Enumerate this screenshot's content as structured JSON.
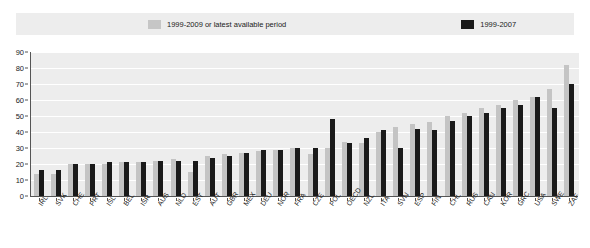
{
  "legend": {
    "entries": [
      {
        "label": "1999-2009 or latest available period",
        "color": "#c6c6c6",
        "swatch": "light"
      },
      {
        "label": "1999-2007",
        "color": "#1a1a1a",
        "swatch": "dark"
      }
    ]
  },
  "y_axis": {
    "ticks": [
      "0",
      "10",
      "20",
      "30",
      "40",
      "50",
      "60",
      "70",
      "80",
      "90"
    ]
  },
  "chart_data": {
    "type": "bar",
    "title": "",
    "subtitle": "",
    "xlabel": "",
    "ylabel": "",
    "ylim": [
      0,
      90
    ],
    "ytick_step": 10,
    "grid": true,
    "legend_position": "top",
    "orientation": "vertical",
    "sorted": "ascending by 1999-2007 series",
    "categories": [
      "IRL",
      "SVK",
      "CHE",
      "PRT",
      "ISL",
      "BEL",
      "ISR",
      "AUS",
      "NLD",
      "EST",
      "AUT",
      "GBR",
      "MEX",
      "DEU",
      "NOR",
      "FRA",
      "CZE",
      "POL",
      "OECD",
      "NZL",
      "ITA",
      "SVN",
      "ESP",
      "FIN",
      "CHL",
      "RUS",
      "CAN",
      "KOR",
      "GRC",
      "USA",
      "SWE",
      "ZAF"
    ],
    "series": [
      {
        "name": "1999-2009 or latest available period",
        "color": "#c6c6c6",
        "values": [
          14,
          14,
          20,
          20,
          20,
          21,
          21,
          22,
          23,
          15,
          25,
          26,
          27,
          28,
          29,
          30,
          26,
          30,
          34,
          33,
          40,
          43,
          45,
          46,
          50,
          52,
          55,
          57,
          60,
          62,
          67,
          82
        ]
      },
      {
        "name": "1999-2007",
        "color": "#1a1a1a",
        "values": [
          16,
          16,
          20,
          20,
          21,
          21,
          21,
          22,
          22,
          22,
          24,
          25,
          27,
          29,
          29,
          30,
          30,
          48,
          33,
          36,
          41,
          30,
          42,
          41,
          47,
          50,
          52,
          55,
          57,
          62,
          55,
          70
        ]
      }
    ]
  }
}
